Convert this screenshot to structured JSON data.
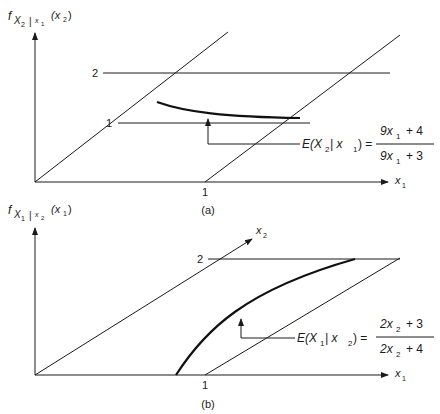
{
  "panel_a": {
    "ylabel_f": "f",
    "ylabel_sub": "X",
    "ylabel_sub2": "2",
    "ylabel_bar": "|",
    "ylabel_cond": "x",
    "ylabel_cond_sub": "1",
    "ylabel_arg": "(x",
    "ylabel_arg_sub": "2",
    "ylabel_close": ")",
    "xlabel": "x",
    "xlabel_sub": "1",
    "tick_x1": "1",
    "tick_depth_1": "1",
    "tick_depth_2": "2",
    "eq_lhs": "E(X",
    "eq_lhs_sub": "2",
    "eq_lhs_bar": " | x",
    "eq_lhs_sub2": "1",
    "eq_lhs_close": ") =",
    "eq_num": "9x",
    "eq_num_sub": "1",
    "eq_num_rest": "+ 4",
    "eq_den": "9x",
    "eq_den_sub": "1",
    "eq_den_rest": "+ 3",
    "caption": "(a)"
  },
  "panel_b": {
    "ylabel_f": "f",
    "ylabel_sub": "X",
    "ylabel_sub2": "1",
    "ylabel_bar": "|",
    "ylabel_cond": "x",
    "ylabel_cond_sub": "2",
    "ylabel_arg": "(x",
    "ylabel_arg_sub": "1",
    "ylabel_close": ")",
    "xlabel": "x",
    "xlabel_sub": "1",
    "depth_label": "x",
    "depth_label_sub": "2",
    "tick_x1": "1",
    "tick_depth_2": "2",
    "eq_lhs": "E(X",
    "eq_lhs_sub": "1",
    "eq_lhs_bar": " | x",
    "eq_lhs_sub2": "2",
    "eq_lhs_close": ") =",
    "eq_num": "2x",
    "eq_num_sub": "2",
    "eq_num_rest": "+ 3",
    "eq_den": "2x",
    "eq_den_sub": "2",
    "eq_den_rest": "+ 4",
    "caption": "(b)"
  }
}
